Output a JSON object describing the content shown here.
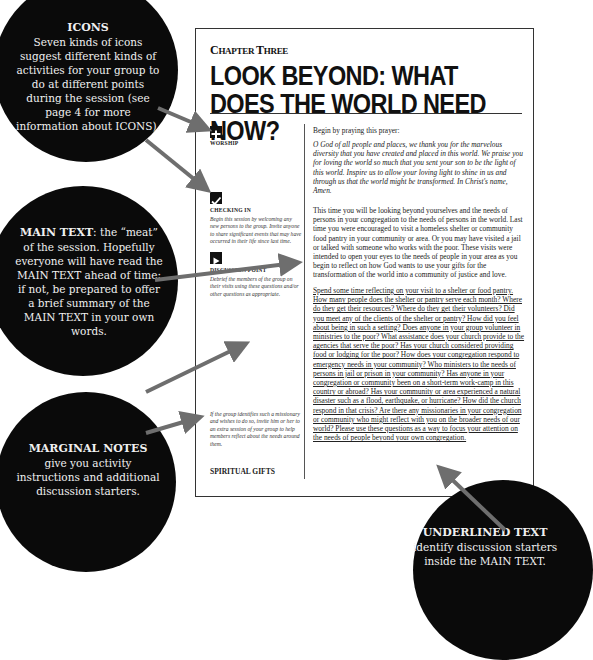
{
  "page": {
    "chapter_label_first": "C",
    "chapter_label_rest": "HAPTER ",
    "chapter_label_first2": "T",
    "chapter_label_rest2": "HREE",
    "title": "LOOK BEYOND: WHAT DOES THE WORLD NEED NOW?",
    "sections": {
      "worship": {
        "icon": "cross-icon",
        "label": "WORSHIP",
        "intro": "Begin by praying this prayer:",
        "prayer": "O God of all people and places, we thank you for the marvelous diversity that you have created and placed in this world. We praise you for loving the world so much that you sent your son to be the light of this world. Inspire us to allow your loving light to shine in us and through us that the world might be transformed. In Christ's name, Amen."
      },
      "checking_in": {
        "icon": "checkmark-icon",
        "label": "CHECKING IN",
        "note": "Begin this session by welcoming any new persons to the group. Invite anyone to share significant events that may have occurred in their life since last time.",
        "main": "This time you will be looking beyond yourselves and the needs of persons in your congregation to the needs of persons in the world. Last time you were encouraged to visit a homeless shelter or community food pantry in your community or area. Or you may have visited a jail or talked with someone who works with the poor. These visits were intended to open your eyes to the needs of people in your area as you begin to reflect on how God wants to use your gifts for the transformation of the world into a community of justice and love."
      },
      "discussion_point": {
        "icon": "play-icon",
        "label": "DISCUSSION POINT",
        "note": "Debrief the members of the group on their visits using these questions and/or other questions as appropriate.",
        "note2": "If the group identifies such a missionary and wishes to do so, invite him or her to an extra session of your group to help members reflect about the needs around them.",
        "main_underlined": "Spend some time reflecting on your visit to a shelter or food pantry. How many people does the shelter or pantry serve each month? Where do they get their resources? Where do they get their volunteers? Did you meet any of the clients of the shelter or pantry? How did you feel about being in such a setting? Does anyone in your group volunteer in ministries to the poor? What assistance does your church provide to the agencies that serve the poor? Has your church considered providing food or lodging for the poor? How does your congregation respond to emergency needs in your community? Who ministers to the needs of persons in jail or prison in your community? Has anyone in your congregation or community been on a short-term work-camp in this country or abroad? Has your community or area experienced a natural disaster such as a flood, earthquake, or hurricane? How did the church respond in that crisis? Are there any missionaries in your congregation or community who might reflect with you on the broader needs of our world? Please use these questions as a way to focus your attention on the needs of people beyond your own congregation."
      }
    },
    "footer": "SPIRITUAL GIFTS"
  },
  "callouts": {
    "icons": {
      "heading": "ICONS",
      "text": "Seven kinds of icons suggest different kinds of activities for your group to do at different points during the session (see page 4 for more information about ICONS)."
    },
    "main_text": {
      "heading": "MAIN TEXT",
      "text": ": the “meat” of the session. Hopefully everyone will have read the MAIN TEXT ahead of time; if not, be prepared to offer a brief summary of the MAIN TEXT in your own words."
    },
    "marginal_notes": {
      "heading": "MARGINAL NOTES",
      "text": "give you activity instructions and additional discussion starters."
    },
    "underlined_text": {
      "heading": "UNDERLINED TEXT",
      "text": "identify discussion starters inside the MAIN TEXT."
    }
  },
  "colors": {
    "callout_bg": "#0a0a0a",
    "arrow": "#6e6e6e",
    "page_border": "#333333"
  }
}
